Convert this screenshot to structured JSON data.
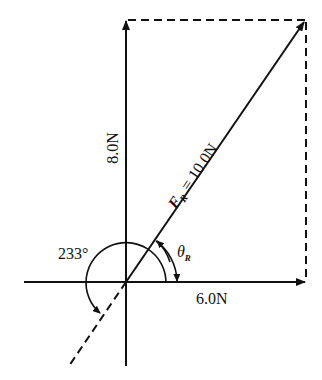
{
  "diagram": {
    "type": "vector-resolution",
    "colors": {
      "ink": "#111111",
      "background": "#ffffff"
    },
    "labels": {
      "vertical_component": "8.0N",
      "horizontal_component": "6.0N",
      "resultant_symbol": "F",
      "resultant_subscript": "R",
      "resultant_value": "= 10.0N",
      "angle_symbol": "θ",
      "angle_subscript": "R",
      "reverse_angle": "233°"
    },
    "vectors": [
      {
        "name": "horizontal",
        "magnitude": "6.0N",
        "direction_deg": 0
      },
      {
        "name": "vertical",
        "magnitude": "8.0N",
        "direction_deg": 90
      },
      {
        "name": "resultant",
        "magnitude": "10.0N",
        "direction_deg": 53
      }
    ],
    "angles": [
      {
        "name": "theta_R",
        "label": "θR"
      },
      {
        "name": "reverse",
        "label": "233°",
        "note": "dashed extension of resultant through origin"
      }
    ]
  }
}
